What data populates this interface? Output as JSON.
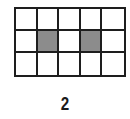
{
  "figure": {
    "label": "2",
    "grid": {
      "rows": 3,
      "cols": 5,
      "line_color": "#1e1e1e",
      "fill_color": "#ffffff",
      "shade_color": "#8c8c8c",
      "shaded_cells": [
        {
          "row": 1,
          "col": 1
        },
        {
          "row": 1,
          "col": 3
        }
      ]
    }
  }
}
